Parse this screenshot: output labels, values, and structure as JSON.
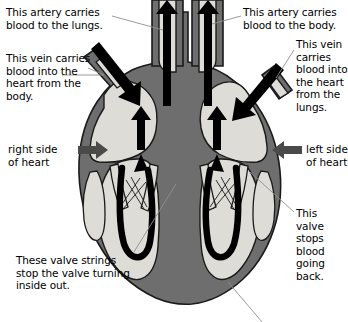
{
  "diagram": {
    "background_color": "#ffffff",
    "colors": {
      "muscle_wall": "#6e6e6e",
      "chamber": "#dddcd7",
      "outline": "#000000",
      "arrow": "#000000",
      "leader_line": "#8f8f8f",
      "text": "#000000"
    }
  },
  "labels": {
    "artery_to_lungs": "This artery carries\nblood to the lungs.",
    "vein_from_body": "This vein carries\nblood into the\nheart from the\nbody.",
    "artery_to_body": "This artery carries\nblood to the body.",
    "vein_from_lungs": "This vein\ncarries\nblood into\nthe heart\nfrom the\nlungs.",
    "valve_stops_blood": "This valve\nstops blood\ngoing back.",
    "valve_strings": "These valve strings\nstop the valve turning\ninside out.",
    "right_side": "right side\nof heart",
    "left_side": "left side\nof heart"
  }
}
